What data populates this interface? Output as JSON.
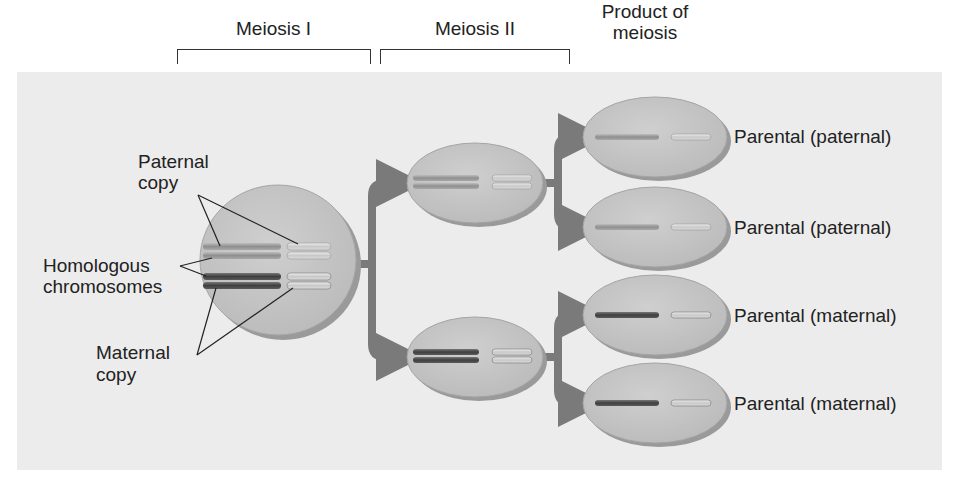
{
  "headers": {
    "meiosis_1": "Meiosis I",
    "meiosis_2": "Meiosis II",
    "product_line1": "Product of",
    "product_line2": "meiosis"
  },
  "left_labels": {
    "paternal_line1": "Paternal",
    "paternal_line2": "copy",
    "homologous_line1": "Homologous",
    "homologous_line2": "chromosomes",
    "maternal_line1": "Maternal",
    "maternal_line2": "copy"
  },
  "products": [
    {
      "label": "Parental (paternal)",
      "type": "paternal"
    },
    {
      "label": "Parental (paternal)",
      "type": "paternal"
    },
    {
      "label": "Parental (maternal)",
      "type": "maternal"
    },
    {
      "label": "Parental (maternal)",
      "type": "maternal"
    }
  ],
  "colors": {
    "panel": "#ececec",
    "cell_fill": "#c4c4c4",
    "cell_shadow": "#9a9a9a",
    "arrow": "#7a7a7a",
    "paternal_chromosome": "#9e9e9e",
    "maternal_chromosome": "#555555",
    "small_chromosome": "#d8d8d8"
  }
}
